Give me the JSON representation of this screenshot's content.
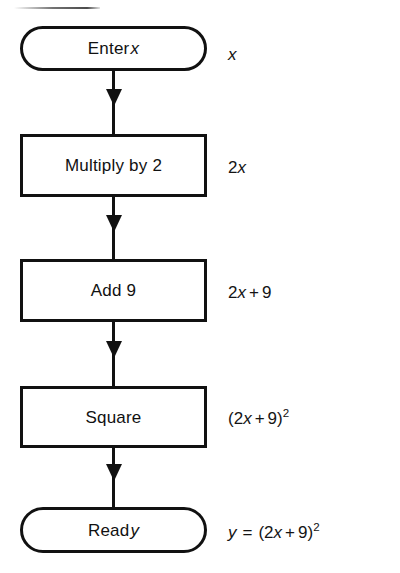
{
  "diagram": {
    "type": "flowchart",
    "orientation": "vertical",
    "line_color": "#111111",
    "fill_color": "#ffffff",
    "background": "#ffffff",
    "nodes": [
      {
        "id": "enter",
        "shape": "terminal",
        "label_prefix": "Enter",
        "label_variable": "x",
        "expression": {
          "plain": "x",
          "parts": [
            {
              "text": "x",
              "style": "italic"
            }
          ]
        }
      },
      {
        "id": "multiply",
        "shape": "process",
        "label_prefix": "Multiply by 2",
        "label_variable": "",
        "expression": {
          "plain": "2x",
          "parts": [
            {
              "text": "2",
              "style": "roman"
            },
            {
              "text": "x",
              "style": "italic"
            }
          ]
        }
      },
      {
        "id": "add",
        "shape": "process",
        "label_prefix": "Add 9",
        "label_variable": "",
        "expression": {
          "plain": "2x + 9",
          "parts": [
            {
              "text": "2",
              "style": "roman"
            },
            {
              "text": "x",
              "style": "italic"
            },
            {
              "text": "+",
              "style": "operator"
            },
            {
              "text": "9",
              "style": "roman"
            }
          ]
        }
      },
      {
        "id": "square",
        "shape": "process",
        "label_prefix": "Square",
        "label_variable": "",
        "expression": {
          "plain": "(2x + 9)2",
          "parts": [
            {
              "text": "(2",
              "style": "roman"
            },
            {
              "text": "x",
              "style": "italic"
            },
            {
              "text": "+",
              "style": "operator"
            },
            {
              "text": "9)",
              "style": "roman"
            },
            {
              "text": "2",
              "style": "superscript"
            }
          ]
        }
      },
      {
        "id": "read",
        "shape": "terminal",
        "label_prefix": "Read",
        "label_variable": "y",
        "expression": {
          "plain": "y = (2x + 9)2",
          "parts": [
            {
              "text": "y",
              "style": "italic"
            },
            {
              "text": "=",
              "style": "equals"
            },
            {
              "text": "(2",
              "style": "roman"
            },
            {
              "text": "x",
              "style": "italic"
            },
            {
              "text": "+",
              "style": "operator"
            },
            {
              "text": "9)",
              "style": "roman"
            },
            {
              "text": "2",
              "style": "superscript"
            }
          ]
        }
      }
    ],
    "edges": [
      {
        "from": "enter",
        "to": "multiply",
        "arrow": "down"
      },
      {
        "from": "multiply",
        "to": "add",
        "arrow": "down"
      },
      {
        "from": "add",
        "to": "square",
        "arrow": "down"
      },
      {
        "from": "square",
        "to": "read",
        "arrow": "down"
      }
    ]
  }
}
